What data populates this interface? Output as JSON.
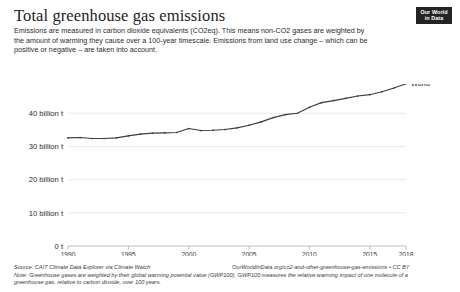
{
  "header": {
    "title": "Total greenhouse gas emissions",
    "subtitle": "Emissions are measured in carbon dioxide equivalents (CO2eq). This means non-CO2 gases are weighted by the amount of warming they cause over a 100-year timescale. Emissions from land use change – which can be positive or negative – are taken into account."
  },
  "logo": {
    "line1": "Our World",
    "line2": "in Data"
  },
  "footer": {
    "source": "Source: CAIT Climate Data Explorer via Climate Watch",
    "link": "OurWorldInData.org/co2-and-other-greenhouse-gas-emissions • CC BY",
    "note": "Note: Greenhouse gases are weighted by their global warming potential value (GWP100). GWP100 measures the relative warming impact of one molecule of a greenhouse gas, relative to carbon dioxide, over 100 years."
  },
  "colors": {
    "line": "#3c3c3c",
    "grid": "#e3e3e3",
    "axis": "#b7b7b7",
    "text": "#2b2b2b",
    "logo_bg": "#242424"
  },
  "chart_data": {
    "type": "line",
    "title": "Total greenhouse gas emissions",
    "xlabel": "",
    "ylabel": "",
    "xlim": [
      1990,
      2018
    ],
    "ylim": [
      0,
      44
    ],
    "grid": true,
    "legend_position": "end-of-line",
    "x_tick_labels": [
      "1990",
      "1995",
      "2000",
      "2005",
      "2010",
      "2015",
      "2018"
    ],
    "x_ticks": [
      1990,
      1995,
      2000,
      2005,
      2010,
      2015,
      2018
    ],
    "y_tick_labels": [
      "0 t",
      "10 billion t",
      "20 billion t",
      "30 billion t",
      "40 billion t"
    ],
    "y_ticks": [
      0,
      10,
      20,
      30,
      40
    ],
    "series": [
      {
        "name": "World",
        "x": [
          1990,
          1991,
          1992,
          1993,
          1994,
          1995,
          1996,
          1997,
          1998,
          1999,
          2000,
          2001,
          2002,
          2003,
          2004,
          2005,
          2006,
          2007,
          2008,
          2009,
          2010,
          2011,
          2012,
          2013,
          2014,
          2015,
          2016,
          2017,
          2018
        ],
        "values": [
          32.6,
          32.7,
          32.4,
          32.4,
          32.6,
          33.2,
          33.7,
          34.0,
          34.1,
          34.2,
          35.4,
          34.8,
          34.9,
          35.1,
          35.6,
          36.4,
          37.4,
          38.7,
          39.6,
          40.0,
          41.8,
          43.2,
          43.8,
          44.5,
          45.2,
          45.6,
          46.5,
          47.6,
          48.9
        ]
      }
    ]
  }
}
